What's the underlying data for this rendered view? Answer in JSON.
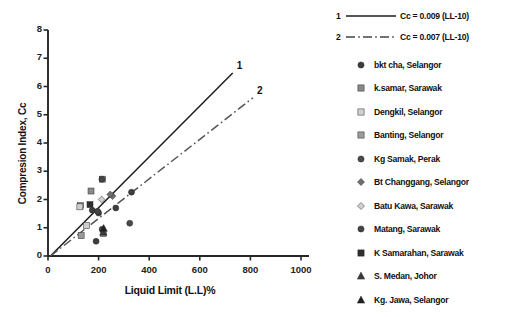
{
  "chart_data": {
    "type": "scatter",
    "title": "",
    "xlabel": "Liquid Limit (L.L)%",
    "ylabel": "Compresion Index, Cc",
    "xlim": [
      0,
      1000
    ],
    "ylim": [
      0,
      8
    ],
    "xticks": [
      "0",
      "200",
      "400",
      "600",
      "800",
      "1000"
    ],
    "yticks": [
      "0",
      "1",
      "2",
      "3",
      "4",
      "5",
      "6",
      "7",
      "8"
    ],
    "grid": false,
    "legend_position": "right",
    "trendlines": [
      {
        "id": "1",
        "label": "Cc = 0.009 (LL-10)",
        "style": "solid",
        "slope": 0.009,
        "intercept_x": 10,
        "x_end": 730,
        "y_end": 6.48,
        "endpoint_label": "1"
      },
      {
        "id": "2",
        "label": "Cc = 0.007 (LL-10)",
        "style": "dash-dot",
        "slope": 0.007,
        "intercept_x": 10,
        "x_end": 810,
        "y_end": 5.6,
        "endpoint_label": "2"
      }
    ],
    "series": [
      {
        "name": "bkt cha, Selangor",
        "marker": "circle",
        "fill": "#3d3d3d",
        "points": [
          [
            175,
            1.62
          ],
          [
            200,
            1.52
          ],
          [
            330,
            2.26
          ],
          [
            268,
            1.7
          ],
          [
            190,
            0.52
          ]
        ]
      },
      {
        "name": "k.samar, Sarawak",
        "marker": "square",
        "fill": "#8a8a8a",
        "points": [
          [
            170,
            2.3
          ],
          [
            128,
            1.78
          ],
          [
            215,
            2.72
          ]
        ]
      },
      {
        "name": "Dengkil, Selangor",
        "marker": "square",
        "fill": "#cfcfcf",
        "points": [
          [
            126,
            1.74
          ],
          [
            152,
            1.08
          ]
        ]
      },
      {
        "name": "Banting, Selangor",
        "marker": "square",
        "fill": "#9a9a9a",
        "points": [
          [
            131,
            0.72
          ],
          [
            218,
            0.8
          ]
        ]
      },
      {
        "name": "Kg Samak, Perak",
        "marker": "circle",
        "fill": "#4a4a4a",
        "points": [
          [
            323,
            1.16
          ],
          [
            214,
            0.95
          ]
        ]
      },
      {
        "name": "Bt Changgang, Selangor",
        "marker": "diamond",
        "fill": "#6f6f6f",
        "points": [
          [
            255,
            2.12
          ],
          [
            246,
            2.18
          ]
        ]
      },
      {
        "name": "Batu Kawa, Sarawak",
        "marker": "diamond",
        "fill": "#d0d0d0",
        "points": [
          [
            212,
            2.0
          ]
        ]
      },
      {
        "name": "Matang, Sarawak",
        "marker": "circle",
        "fill": "#444444",
        "points": [
          [
            196,
            1.58
          ],
          [
            213,
            2.72
          ]
        ]
      },
      {
        "name": "K Samarahan, Sarawak",
        "marker": "square",
        "fill": "#2e2e2e",
        "points": [
          [
            166,
            1.82
          ]
        ]
      },
      {
        "name": "S. Medan, Johor",
        "marker": "triangle",
        "fill": "#3a3a3a",
        "points": [
          [
            219,
            0.84
          ]
        ]
      },
      {
        "name": "Kg. Jawa, Selangor",
        "marker": "triangle",
        "fill": "#1f1f1f",
        "points": [
          [
            220,
            0.98
          ]
        ]
      }
    ]
  }
}
